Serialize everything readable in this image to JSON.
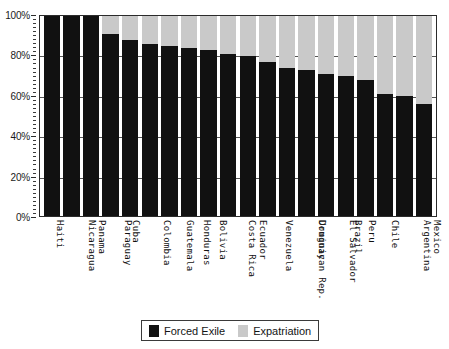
{
  "chart_data": {
    "type": "bar",
    "subtype": "stacked-100-percent",
    "title": "",
    "xlabel": "",
    "ylabel": "",
    "ylim": [
      0,
      100
    ],
    "y_tick_labels": [
      "0%",
      "20%",
      "40%",
      "60%",
      "80%",
      "100%"
    ],
    "y_tick_values": [
      0,
      20,
      40,
      60,
      80,
      100
    ],
    "grid": true,
    "legend_position": "bottom",
    "categories": [
      "Haiti",
      "Nicaragua",
      "Panama",
      "Paraguay",
      "Cuba",
      "Colombia",
      "Guatemala",
      "Honduras",
      "Bolivia",
      "Costa Rica",
      "Ecuador",
      "Venezuela",
      "Dominican Rep.",
      "Uruguay",
      "El Salvador",
      "Brazil",
      "Peru",
      "Chile",
      "Argentina",
      "Mexico"
    ],
    "series": [
      {
        "name": "Forced Exile",
        "color": "#111111",
        "values": [
          100,
          100,
          100,
          91,
          88,
          86,
          85,
          84,
          83,
          81,
          80,
          77,
          74,
          73,
          71,
          70,
          68,
          61,
          60,
          56
        ]
      },
      {
        "name": "Expatriation",
        "color": "#c9c9c9",
        "values": [
          0,
          0,
          0,
          9,
          12,
          14,
          15,
          16,
          17,
          19,
          20,
          23,
          26,
          27,
          29,
          30,
          32,
          39,
          40,
          44
        ]
      }
    ]
  },
  "legend": {
    "items": [
      {
        "label": "Forced Exile",
        "swatch": "dark"
      },
      {
        "label": "Expatriation",
        "swatch": "light"
      }
    ]
  }
}
